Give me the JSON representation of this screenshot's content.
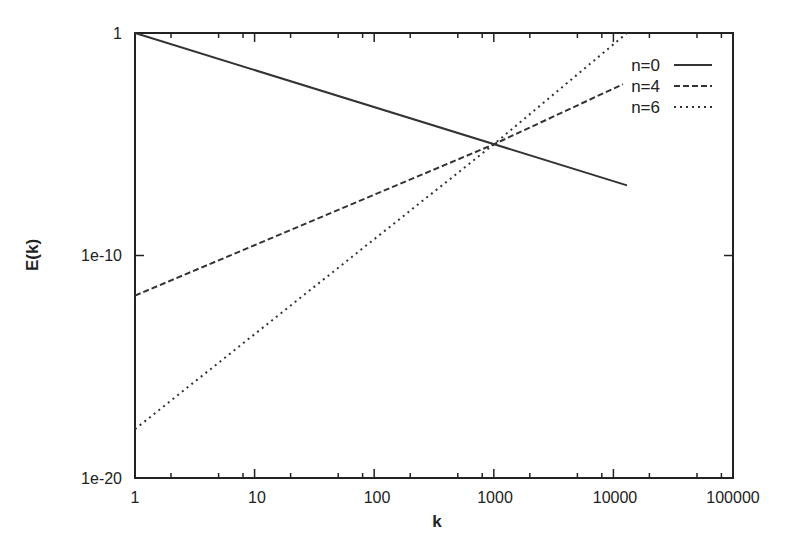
{
  "chart_data": {
    "type": "line",
    "title": "",
    "xlabel": "k",
    "ylabel": "E(k)",
    "xscale": "log",
    "yscale": "log",
    "xlim": [
      1,
      100000
    ],
    "ylim": [
      1e-20,
      1
    ],
    "grid": false,
    "legend_position": "upper right (inside)",
    "x_tick_labels": [
      "1",
      "10",
      "100",
      "1000",
      "10000",
      "100000"
    ],
    "y_tick_labels": [
      "1e-20",
      "1e-10",
      "1"
    ],
    "series": [
      {
        "name": "n=0",
        "style": "solid",
        "x": [
          1,
          13000
        ],
        "log10_y": [
          0,
          -6.85
        ]
      },
      {
        "name": "n=4",
        "style": "dashed",
        "x": [
          1,
          1000,
          12000
        ],
        "log10_y": [
          -11.8,
          -5.0,
          -2.3
        ]
      },
      {
        "name": "n=6",
        "style": "dotted",
        "x": [
          1,
          1000,
          13000
        ],
        "log10_y": [
          -17.8,
          -5.0,
          0
        ]
      }
    ],
    "annotations": [
      "All three curves intersect near k=1000, E(k)≈1e-5"
    ]
  },
  "axes": {
    "x_title": "k",
    "y_title": "E(k)",
    "x_ticks": [
      {
        "label": "1",
        "value": 1
      },
      {
        "label": "10",
        "value": 10
      },
      {
        "label": "100",
        "value": 100
      },
      {
        "label": "1000",
        "value": 1000
      },
      {
        "label": "10000",
        "value": 10000
      },
      {
        "label": "100000",
        "value": 100000
      }
    ],
    "y_ticks": [
      {
        "label": "1",
        "value": 0
      },
      {
        "label": "1e-10",
        "value": -10
      },
      {
        "label": "1e-20",
        "value": -20
      }
    ]
  },
  "legend": {
    "items": [
      {
        "label": "n=0",
        "style": "solid"
      },
      {
        "label": "n=4",
        "style": "dashed"
      },
      {
        "label": "n=6",
        "style": "dotted"
      }
    ]
  },
  "colors": {
    "line": "#333333",
    "axis": "#222222",
    "background": "#ffffff"
  }
}
